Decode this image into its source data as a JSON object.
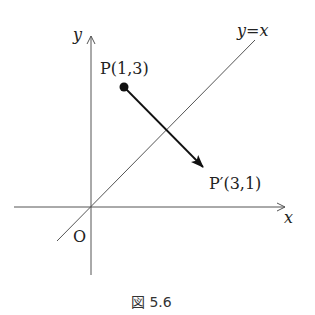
{
  "figure": {
    "caption": "図 5.6",
    "axes": {
      "x_label": "x",
      "y_label": "y",
      "origin_label": "O"
    },
    "line": {
      "label": "y=x",
      "equation": "y = x"
    },
    "points": [
      {
        "name": "P",
        "label": "P(1,3)",
        "x": 1,
        "y": 3
      },
      {
        "name": "P'",
        "label": "P′(3,1)",
        "x": 3,
        "y": 1
      }
    ],
    "arrow": {
      "from": "P",
      "to": "P'",
      "meaning": "reflection across y=x"
    }
  }
}
